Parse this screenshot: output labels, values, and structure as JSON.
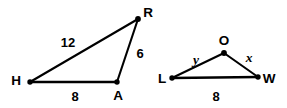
{
  "figure": {
    "stroke_color": "#000000",
    "background_color": "#ffffff",
    "triangles": [
      {
        "name": "triangle-HAR",
        "vertices": [
          {
            "id": "H",
            "label": "H",
            "x": 30,
            "y": 82,
            "label_x": 16,
            "label_y": 81
          },
          {
            "id": "A",
            "label": "A",
            "x": 117,
            "y": 82,
            "label_x": 118,
            "label_y": 96
          },
          {
            "id": "R",
            "label": "R",
            "x": 138,
            "y": 19,
            "label_x": 148,
            "label_y": 13
          }
        ],
        "sides": [
          {
            "id": "HR",
            "label": "12",
            "label_x": 68,
            "label_y": 42
          },
          {
            "id": "AR",
            "label": "6",
            "label_x": 140,
            "label_y": 53
          },
          {
            "id": "HA",
            "label": "8",
            "label_x": 75,
            "label_y": 96
          }
        ]
      },
      {
        "name": "triangle-LWO",
        "vertices": [
          {
            "id": "L",
            "label": "L",
            "x": 172,
            "y": 78,
            "label_x": 162,
            "label_y": 79
          },
          {
            "id": "W",
            "label": "W",
            "x": 258,
            "y": 77,
            "label_x": 269,
            "label_y": 79
          },
          {
            "id": "O",
            "label": "O",
            "x": 224,
            "y": 53,
            "label_x": 224,
            "label_y": 41
          }
        ],
        "sides": [
          {
            "id": "LO",
            "label": "y",
            "label_x": 196,
            "label_y": 60
          },
          {
            "id": "OW",
            "label": "x",
            "label_x": 249,
            "label_y": 58
          },
          {
            "id": "LW",
            "label": "8",
            "label_x": 216,
            "label_y": 96
          }
        ]
      }
    ]
  }
}
